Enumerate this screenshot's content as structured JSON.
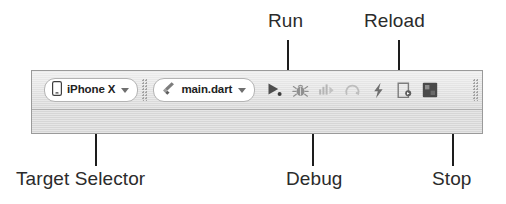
{
  "annotations": {
    "run": "Run",
    "reload": "Reload",
    "target_selector": "Target Selector",
    "debug": "Debug",
    "stop": "Stop"
  },
  "toolbar": {
    "target_selector": {
      "icon": "phone-icon",
      "value": "iPhone X",
      "caret": "chevron-down-icon"
    },
    "run_configuration": {
      "icon": "flutter-dart-icon",
      "value": "main.dart",
      "caret": "chevron-down-icon"
    },
    "buttons": [
      {
        "name": "run-button",
        "icon": "play-triangle-icon",
        "label": "Run"
      },
      {
        "name": "debug-button",
        "icon": "bug-icon",
        "label": "Debug"
      },
      {
        "name": "profile-button",
        "icon": "profile-bars-icon",
        "label": "Run with Profiling"
      },
      {
        "name": "observatory-button",
        "icon": "observatory-spiral-icon",
        "label": "Observatory"
      },
      {
        "name": "hot-reload-button",
        "icon": "lightning-bolt-icon",
        "label": "Hot Reload"
      },
      {
        "name": "hot-restart-button",
        "icon": "device-restart-icon",
        "label": "Hot Restart"
      },
      {
        "name": "stop-button",
        "icon": "stop-square-icon",
        "label": "Stop"
      }
    ],
    "drag_handles": 3
  },
  "colors": {
    "toolbar_background": "#d9d9d9",
    "toolbar_border": "#9a9a9a",
    "combo_background": "#ffffff",
    "text": "#222222",
    "annotation_text": "#2b2b2b",
    "leader_line": "#1d1d1d",
    "icon_active": "#5a5a5a",
    "icon_disabled": "#b0b0b0",
    "stop_icon": "#4a4a4a"
  }
}
